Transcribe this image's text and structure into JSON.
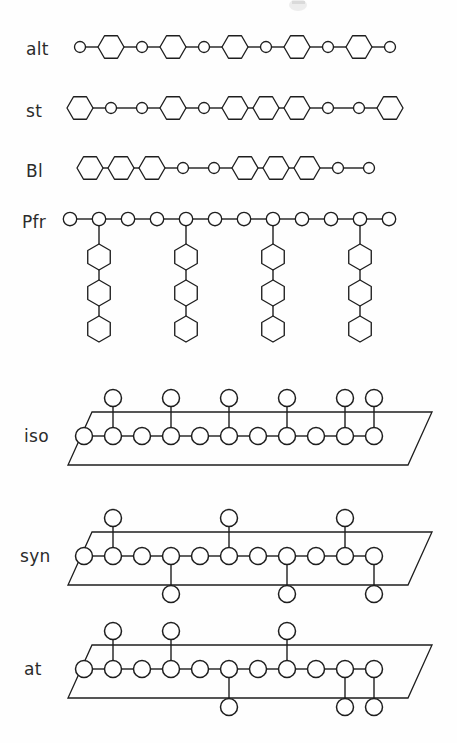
{
  "figure": {
    "background_color": "#fefefe",
    "stroke_color": "#1e1e1e",
    "fill_color": "#ffffff",
    "width": 457,
    "height": 743
  },
  "geometry": {
    "small_circle_radius": 5.5,
    "large_circle_radius": 8.5,
    "hexagon_radius": 13,
    "backbone_spacing_linear": 31,
    "backbone_spacing_plane": 29,
    "pendant_length": 34,
    "graft_spacing": 42
  },
  "rows": [
    {
      "id": "alt",
      "label": "alt",
      "label_x": 26,
      "label_y": 55,
      "type": "linear",
      "description": "alternating copolymer",
      "baseline_y": 47,
      "start_x": 80,
      "spacing": 31,
      "sequence": [
        "circle",
        "hex",
        "circle",
        "hex",
        "circle",
        "hex",
        "circle",
        "hex",
        "circle",
        "hex",
        "circle"
      ]
    },
    {
      "id": "st",
      "label": "st",
      "label_x": 26,
      "label_y": 117,
      "type": "linear",
      "description": "statistical copolymer",
      "baseline_y": 108,
      "start_x": 80,
      "spacing": 31,
      "sequence": [
        "hex",
        "circle",
        "circle",
        "hex",
        "circle",
        "hex",
        "hex",
        "hex",
        "circle",
        "circle",
        "hex"
      ]
    },
    {
      "id": "bl",
      "label": "Bl",
      "label_x": 26,
      "label_y": 177,
      "type": "linear",
      "description": "block copolymer",
      "baseline_y": 168,
      "start_x": 90,
      "spacing": 31,
      "sequence": [
        "hex",
        "hex",
        "hex",
        "circle",
        "circle",
        "hex",
        "hex",
        "hex",
        "circle",
        "circle"
      ]
    },
    {
      "id": "pfr",
      "label": "Pfr",
      "label_x": 22,
      "label_y": 228,
      "type": "graft",
      "description": "graft copolymer",
      "baseline_y": 219,
      "start_x": 70,
      "spacing": 29,
      "backbone_count": 12,
      "graft_positions": [
        1,
        4,
        7,
        10
      ],
      "graft_units": 3,
      "graft_first_offset": 38,
      "graft_unit_spacing": 36
    },
    {
      "id": "iso",
      "label": "iso",
      "label_x": 24,
      "label_y": 442,
      "type": "tactic",
      "description": "isotactic",
      "baseline_y": 436,
      "start_x": 84,
      "spacing": 29,
      "backbone_count": 11,
      "pendant_length": 38,
      "pendants_up": [
        1,
        3,
        5,
        7,
        9,
        10
      ],
      "pendants_down": [],
      "plane": {
        "x1": 68,
        "x2": 432,
        "y_top": 412,
        "y_bot": 465,
        "skew": 24
      }
    },
    {
      "id": "syn",
      "label": "syn",
      "label_x": 20,
      "label_y": 562,
      "type": "tactic",
      "description": "syndiotactic",
      "baseline_y": 556,
      "start_x": 84,
      "spacing": 29,
      "backbone_count": 11,
      "pendant_length": 38,
      "pendants_up": [
        1,
        5,
        9
      ],
      "pendants_down": [
        3,
        7,
        10
      ],
      "plane": {
        "x1": 68,
        "x2": 432,
        "y_top": 532,
        "y_bot": 585,
        "skew": 24
      }
    },
    {
      "id": "at",
      "label": "at",
      "label_x": 24,
      "label_y": 675,
      "type": "tactic",
      "description": "atactic",
      "baseline_y": 669,
      "start_x": 84,
      "spacing": 29,
      "backbone_count": 11,
      "pendant_length": 38,
      "pendants_up": [
        1,
        3,
        7
      ],
      "pendants_down": [
        5,
        9,
        10
      ],
      "plane": {
        "x1": 68,
        "x2": 432,
        "y_top": 645,
        "y_bot": 698,
        "skew": 24
      }
    }
  ]
}
